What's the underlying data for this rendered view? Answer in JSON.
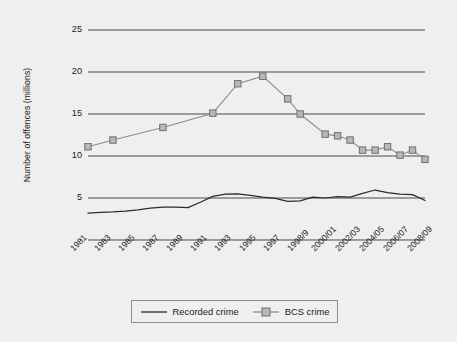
{
  "chart_data": {
    "type": "line",
    "title": "",
    "xlabel": "",
    "ylabel": "Number of offences (millions)",
    "ylim": [
      0,
      25
    ],
    "yticks": [
      0,
      5,
      10,
      15,
      20,
      25
    ],
    "ytick_labels": [
      "-",
      "5",
      "10",
      "15",
      "20",
      "25"
    ],
    "grid": "horizontal",
    "legend_position": "bottom-center",
    "x_tick_labels": [
      "1981",
      "1983",
      "1985",
      "1987",
      "1989",
      "1991",
      "1993",
      "1995",
      "1997",
      "1998/9",
      "2000/01",
      "2002/03",
      "2004/05",
      "2006/07",
      "2008/09"
    ],
    "x_categories": [
      "1981",
      "1982",
      "1983",
      "1984",
      "1985",
      "1986",
      "1987",
      "1988",
      "1989",
      "1990",
      "1991",
      "1992",
      "1993",
      "1994",
      "1995",
      "1996",
      "1997",
      "1998/9",
      "1999/00",
      "2000/01",
      "2001/02",
      "2002/03",
      "2003/04",
      "2004/05",
      "2005/06",
      "2006/07",
      "2007/08",
      "2008/09"
    ],
    "series": [
      {
        "name": "Recorded crime",
        "marker": "none",
        "color": "#2b2b2b",
        "values": [
          3.2,
          3.3,
          3.35,
          3.45,
          3.6,
          3.8,
          3.9,
          3.9,
          3.85,
          4.5,
          5.2,
          5.45,
          5.5,
          5.3,
          5.1,
          4.95,
          4.6,
          4.65,
          5.1,
          5.0,
          5.15,
          5.1,
          5.55,
          5.95,
          5.65,
          5.45,
          5.4,
          4.7
        ]
      },
      {
        "name": "BCS crime",
        "marker": "square",
        "color": "#8d8d8d",
        "marker_fill": "#b8b8b8",
        "values": [
          11.1,
          null,
          11.9,
          null,
          null,
          null,
          13.4,
          null,
          null,
          null,
          15.1,
          null,
          18.6,
          null,
          19.5,
          null,
          16.8,
          15.0,
          null,
          12.6,
          12.4,
          11.9,
          10.7,
          10.7,
          11.1,
          10.1,
          10.7,
          9.6
        ]
      }
    ],
    "bcs_points": [
      {
        "x": "1981",
        "y": 11.1
      },
      {
        "x": "1983",
        "y": 11.9
      },
      {
        "x": "1987",
        "y": 13.4
      },
      {
        "x": "1991",
        "y": 15.1
      },
      {
        "x": "1993",
        "y": 18.6
      },
      {
        "x": "1995",
        "y": 19.5
      },
      {
        "x": "1997",
        "y": 16.8
      },
      {
        "x": "1998/9",
        "y": 15.0
      },
      {
        "x": "2000/01",
        "y": 12.6
      },
      {
        "x": "2001/02",
        "y": 12.4
      },
      {
        "x": "2002/03",
        "y": 11.9
      },
      {
        "x": "2003/04",
        "y": 10.7
      },
      {
        "x": "2004/05",
        "y": 10.7
      },
      {
        "x": "2005/06",
        "y": 11.1
      },
      {
        "x": "2006/07",
        "y": 10.1
      },
      {
        "x": "2007/08",
        "y": 10.7
      },
      {
        "x": "2008/09",
        "y": 9.6
      }
    ]
  },
  "axes": {
    "y_title": "Number of offences (millions)",
    "y_labels": [
      "25",
      "20",
      "15",
      "10",
      "5",
      "-"
    ],
    "x_labels": [
      "1981",
      "1983",
      "1985",
      "1987",
      "1989",
      "1991",
      "1993",
      "1995",
      "1997",
      "1998/9",
      "2000/01",
      "2002/03",
      "2004/05",
      "2006/07",
      "2008/09"
    ]
  },
  "legend": {
    "items": [
      {
        "label": "Recorded crime",
        "marker": "line",
        "color": "#2b2b2b"
      },
      {
        "label": "BCS crime",
        "marker": "line-square",
        "color": "#8d8d8d"
      }
    ]
  },
  "caption": {
    "text": ""
  },
  "colors": {
    "background": "#efefef",
    "gridline": "#4a4a4a",
    "recorded_line": "#2b2b2b",
    "bcs_line": "#8d8d8d",
    "bcs_marker_fill": "#b8b8b8",
    "text": "#1c1c1c"
  }
}
